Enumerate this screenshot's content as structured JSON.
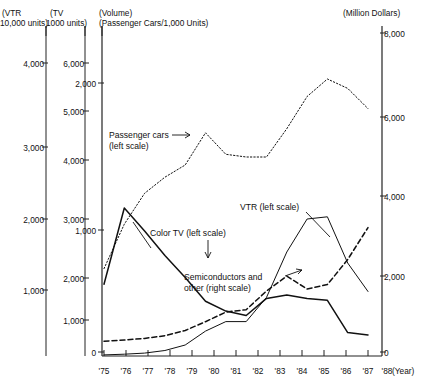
{
  "headers": {
    "left1_line1": "(VTR",
    "left1_line2": "10,000 units)",
    "left2_line1": "(TV",
    "left2_line2": "1000 units)",
    "left3_line1": "(Volume)",
    "left3_line2": "(Passenger Cars/1,000 Units)",
    "right_line1": "(Million Dollars)"
  },
  "annotations": {
    "passenger_cars_l1": "Passenger cars",
    "passenger_cars_l2": "(left scale)",
    "vtr": "VTR (left scale)",
    "color_tv": "Color TV (left scale)",
    "semis_l1": "Semiconductors and",
    "semis_l2": "other (right scale)",
    "year_label": "(Year)"
  },
  "axes": {
    "vtr_ticks": [
      "1,000",
      "2,000",
      "3,000",
      "4,000"
    ],
    "tv_ticks": [
      "1,000",
      "2,000",
      "3,000",
      "4,000",
      "5,000",
      "6,000"
    ],
    "cars_ticks": [
      "0",
      "1,000",
      "2,000"
    ],
    "dollars_ticks": [
      "0",
      "2,000",
      "4,000",
      "6,000",
      "8,000"
    ],
    "years": [
      "'75",
      "'76",
      "'77",
      "'78",
      "'79",
      "'80",
      "'81",
      "'82",
      "'83",
      "'84",
      "'85",
      "'86",
      "'87",
      "'88"
    ]
  },
  "chart_data": {
    "type": "line",
    "title": "",
    "xlabel": "(Year)",
    "ylabel": "",
    "grid": false,
    "legend": "inline-annotations",
    "x": [
      "'75",
      "'76",
      "'77",
      "'78",
      "'79",
      "'80",
      "'81",
      "'82",
      "'83",
      "'84",
      "'85",
      "'86",
      "'87",
      "'88"
    ],
    "axis_ranges": {
      "vtr_left_10000units": [
        0,
        4500
      ],
      "tv_left_1000units": [
        0,
        6500
      ],
      "passenger_cars_1000units": [
        0,
        2200
      ],
      "right_million_dollars": [
        0,
        8000
      ]
    },
    "series": [
      {
        "name": "Passenger cars (left scale)",
        "axis": "passenger_cars_1000units",
        "style": "dotted",
        "units": "1,000 Units",
        "values": [
          620,
          950,
          1180,
          1300,
          1390,
          1630,
          1470,
          1450,
          1450,
          1660,
          1900,
          2030,
          1960,
          1810
        ]
      },
      {
        "name": "Color TV (left scale)",
        "axis": "tv_left_1000units",
        "style": "solid",
        "units": "1000 units",
        "values": [
          1470,
          3030,
          2560,
          2060,
          1610,
          1120,
          920,
          830,
          1180,
          1250,
          1180,
          1140,
          480,
          430
        ]
      },
      {
        "name": "VTR (left scale)",
        "axis": "vtr_left_10000units",
        "style": "solid-thin",
        "units": "10,000 units",
        "values": [
          15,
          25,
          40,
          75,
          150,
          340,
          470,
          470,
          800,
          1420,
          1870,
          1900,
          1270,
          880
        ]
      },
      {
        "name": "Semiconductors and other (right scale)",
        "axis": "right_million_dollars",
        "style": "dashed",
        "units": "Million Dollars",
        "values": [
          270,
          300,
          340,
          410,
          540,
          760,
          1000,
          1060,
          1530,
          1900,
          1580,
          1690,
          2320,
          3120
        ]
      }
    ]
  }
}
